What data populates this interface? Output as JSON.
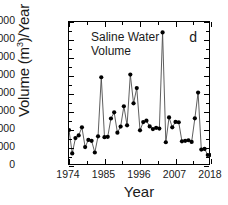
{
  "figure": {
    "panel_label": "d",
    "annotation_line1": "Saline Water",
    "annotation_line2": "Volume",
    "xlabel": "Year",
    "ylabel_pre": "Volume (m",
    "ylabel_sup": "3",
    "ylabel_post": ")/Year",
    "line_color": "#4d4d4d",
    "marker_color": "#000000",
    "axis_color": "#000000",
    "background": "#ffffff"
  },
  "chart_data": {
    "type": "line",
    "title": "Saline Water Volume",
    "xlabel": "Year",
    "ylabel": "Volume (m3)/Year",
    "xlim": [
      1974,
      2018
    ],
    "ylim": [
      0,
      80000
    ],
    "xticks": [
      1974,
      1985,
      1996,
      2007,
      2018
    ],
    "xtick_labels": [
      "1974",
      "1985",
      "1996",
      "2007",
      "2018"
    ],
    "yticks": [
      0,
      10000,
      20000,
      30000,
      40000,
      50000,
      60000,
      70000,
      80000
    ],
    "ytick_labels": [
      "0",
      "10000",
      "20000",
      "30000",
      "40000",
      "50000",
      "60000",
      "70000",
      "80000"
    ],
    "minor_ticks": true,
    "grid": false,
    "legend": false,
    "marker": "filled-circle",
    "series": [
      {
        "name": "Saline Water Volume",
        "x": [
          1974,
          1975,
          1976,
          1977,
          1978,
          1979,
          1980,
          1981,
          1982,
          1983,
          1984,
          1985,
          1986,
          1987,
          1988,
          1989,
          1990,
          1991,
          1992,
          1993,
          1994,
          1995,
          1996,
          1997,
          1998,
          1999,
          2000,
          2001,
          2002,
          2003,
          2004,
          2005,
          2006,
          2007,
          2008,
          2009,
          2010,
          2011,
          2012,
          2013,
          2014,
          2015,
          2016,
          2017,
          2018
        ],
        "values": [
          20000,
          7000,
          15500,
          17000,
          21500,
          10500,
          14500,
          14000,
          7500,
          16500,
          49300,
          16000,
          16200,
          26400,
          29800,
          18500,
          21900,
          33200,
          22600,
          50800,
          34800,
          43300,
          19800,
          24400,
          25200,
          22000,
          20500,
          21200,
          20800,
          74200,
          13200,
          27000,
          21500,
          24500,
          24300,
          13700,
          14000,
          14300,
          13400,
          26500,
          40800,
          9100,
          9500,
          6100,
          6100
        ]
      }
    ],
    "annotations": [
      {
        "text": "Saline Water Volume",
        "position": "upper-left-inside"
      },
      {
        "text": "d",
        "position": "upper-right-inside"
      }
    ]
  }
}
